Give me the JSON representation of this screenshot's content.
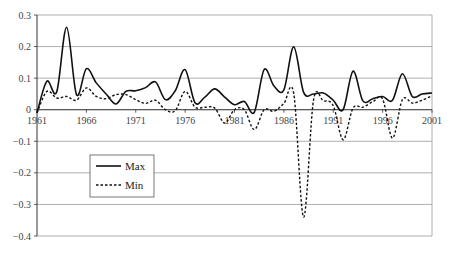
{
  "chart_data": {
    "type": "line",
    "title": "",
    "xlabel": "",
    "ylabel": "",
    "xlim": [
      1961,
      2001
    ],
    "ylim": [
      -0.4,
      0.3
    ],
    "grid": true,
    "legend_position": "inside-lower-left",
    "x_tick_labels": [
      "1961",
      "1966",
      "1971",
      "1976",
      "1981",
      "1986",
      "1991",
      "1996",
      "2001"
    ],
    "y_tick_labels": [
      "0.3",
      "0.2",
      "0.1",
      "0",
      "-0.1",
      "-0.2",
      "-0.3",
      "-0.4"
    ],
    "y_ticks": [
      0.3,
      0.2,
      0.1,
      0,
      -0.1,
      -0.2,
      -0.3,
      -0.4
    ],
    "x": [
      1961,
      1962,
      1963,
      1964,
      1965,
      1966,
      1967,
      1968,
      1969,
      1970,
      1971,
      1972,
      1973,
      1974,
      1975,
      1976,
      1977,
      1978,
      1979,
      1980,
      1981,
      1982,
      1983,
      1984,
      1985,
      1986,
      1987,
      1988,
      1989,
      1990,
      1991,
      1992,
      1993,
      1994,
      1995,
      1996,
      1997,
      1998,
      1999,
      2000,
      2001
    ],
    "series": [
      {
        "name": "Max",
        "style": "solid",
        "values": [
          -0.01,
          0.09,
          0.057,
          0.261,
          0.048,
          0.13,
          0.085,
          0.05,
          0.018,
          0.058,
          0.06,
          0.07,
          0.088,
          0.032,
          0.06,
          0.127,
          0.022,
          0.04,
          0.066,
          0.04,
          0.016,
          0.026,
          -0.008,
          0.127,
          0.075,
          0.063,
          0.199,
          0.055,
          0.05,
          0.053,
          0.03,
          0.0,
          0.122,
          0.028,
          0.035,
          0.042,
          0.03,
          0.114,
          0.042,
          0.05,
          0.053
        ]
      },
      {
        "name": "Min",
        "style": "dashed",
        "values": [
          -0.01,
          0.058,
          0.037,
          0.042,
          0.03,
          0.069,
          0.042,
          0.035,
          0.048,
          0.048,
          0.032,
          0.02,
          0.03,
          0.0,
          -0.003,
          0.058,
          0.008,
          0.008,
          0.005,
          -0.042,
          0.0,
          0.0,
          -0.063,
          0.0,
          -0.005,
          0.02,
          0.051,
          -0.34,
          0.03,
          0.028,
          0.013,
          -0.095,
          0.005,
          0.008,
          0.025,
          0.034,
          -0.09,
          0.032,
          0.021,
          0.03,
          0.044
        ]
      }
    ]
  },
  "legend": {
    "items": [
      {
        "label": "Max",
        "style": "solid"
      },
      {
        "label": "Min",
        "style": "dashed"
      }
    ]
  },
  "colors": {
    "line": "#111111",
    "grid": "#9a9a9a",
    "axis": "#333333"
  }
}
